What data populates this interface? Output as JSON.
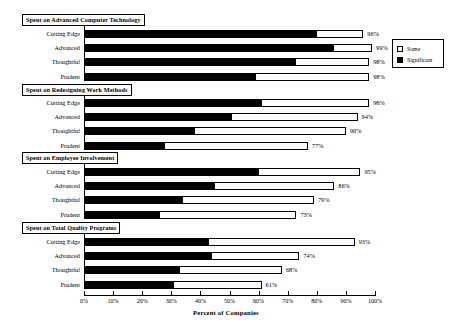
{
  "chart_data": {
    "type": "bar",
    "title": "",
    "xlabel": "Percent of Companies",
    "ylabel": "",
    "xlim": [
      0,
      100
    ],
    "grid": false,
    "orientation": "horizontal",
    "stacked": true,
    "legend_position": "top-right",
    "tick_labels": [
      "0%",
      "10%",
      "20%",
      "30%",
      "40%",
      "50%",
      "60%",
      "70%",
      "80%",
      "90%",
      "100%"
    ],
    "tick_values": [
      0,
      10,
      20,
      30,
      40,
      50,
      60,
      70,
      80,
      90,
      100
    ],
    "series": [
      {
        "name": "Significant",
        "color": "#000000"
      },
      {
        "name": "Some",
        "color": "#ffffff"
      }
    ],
    "categories": [
      "Cutting Edge",
      "Advanced",
      "Thoughtful",
      "Prudent"
    ],
    "panels": [
      {
        "title": "Spent on Advanced Computer Technology",
        "rows": [
          {
            "category": "Cutting Edge",
            "significant": 80,
            "some": 16,
            "total": 96,
            "total_label": "96%"
          },
          {
            "category": "Advanced",
            "significant": 86,
            "some": 13,
            "total": 99,
            "total_label": "99%"
          },
          {
            "category": "Thoughtful",
            "significant": 73,
            "some": 25,
            "total": 98,
            "total_label": "98%"
          },
          {
            "category": "Prudent",
            "significant": 59,
            "some": 39,
            "total": 98,
            "total_label": "98%"
          }
        ]
      },
      {
        "title": "Spent on Redesigning Work Methods",
        "rows": [
          {
            "category": "Cutting Edge",
            "significant": 61,
            "some": 37,
            "total": 98,
            "total_label": "98%"
          },
          {
            "category": "Advanced",
            "significant": 51,
            "some": 43,
            "total": 94,
            "total_label": "94%"
          },
          {
            "category": "Thoughtful",
            "significant": 38,
            "some": 52,
            "total": 90,
            "total_label": "90%"
          },
          {
            "category": "Prudent",
            "significant": 28,
            "some": 49,
            "total": 77,
            "total_label": "77%"
          }
        ]
      },
      {
        "title": "Spent on Employee Involvement",
        "rows": [
          {
            "category": "Cutting Edge",
            "significant": 60,
            "some": 35,
            "total": 95,
            "total_label": "95%"
          },
          {
            "category": "Advanced",
            "significant": 45,
            "some": 41,
            "total": 86,
            "total_label": "86%"
          },
          {
            "category": "Thoughtful",
            "significant": 34,
            "some": 45,
            "total": 79,
            "total_label": "79%"
          },
          {
            "category": "Prudent",
            "significant": 26,
            "some": 47,
            "total": 73,
            "total_label": "73%"
          }
        ]
      },
      {
        "title": "Spent on Total Quality Programs",
        "rows": [
          {
            "category": "Cutting Edge",
            "significant": 43,
            "some": 50,
            "total": 93,
            "total_label": "93%"
          },
          {
            "category": "Advanced",
            "significant": 44,
            "some": 30,
            "total": 74,
            "total_label": "74%"
          },
          {
            "category": "Thoughtful",
            "significant": 33,
            "some": 35,
            "total": 68,
            "total_label": "68%"
          },
          {
            "category": "Prudent",
            "significant": 31,
            "some": 30,
            "total": 61,
            "total_label": "61%"
          }
        ]
      }
    ]
  }
}
